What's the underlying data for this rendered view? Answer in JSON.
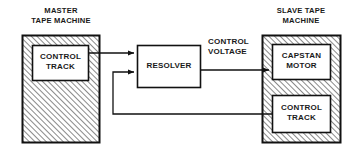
{
  "diagram": {
    "machines": [
      {
        "id": "master",
        "caption": "MASTER\nTAPE MACHINE",
        "fill": "hatched",
        "blocks": [
          {
            "id": "master-control-track",
            "label": "CONTROL\nTRACK"
          }
        ]
      },
      {
        "id": "slave",
        "caption": "SLAVE TAPE\nMACHINE",
        "fill": "hatched",
        "blocks": [
          {
            "id": "slave-capstan-motor",
            "label": "CAPSTAN\nMOTOR"
          },
          {
            "id": "slave-control-track",
            "label": "CONTROL\nTRACK"
          }
        ]
      }
    ],
    "processor": {
      "id": "resolver",
      "label": "RESOLVER"
    },
    "signals": [
      {
        "id": "control-voltage",
        "label": "CONTROL\nVOLTAGE"
      }
    ],
    "colors": {
      "stroke": "#111111",
      "hatch": "#555555",
      "background": "#ffffff",
      "text": "#1a1a1a"
    }
  }
}
